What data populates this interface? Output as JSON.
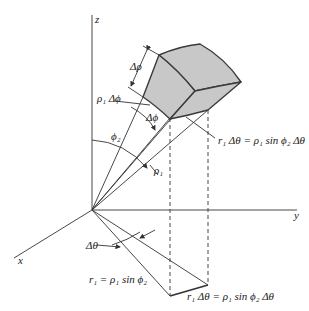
{
  "figure": {
    "axes": {
      "z_label": "z",
      "y_label": "y",
      "x_label": "x"
    },
    "labels": {
      "delta_rho": "Δρ",
      "rho1_delta_phi": "ρ₁ Δϕ",
      "delta_phi": "Δϕ",
      "phi2": "ϕ₂",
      "rho1": "ρ₁",
      "r1_dtheta_top": "r₁ Δθ = ρ₁ sin ϕ₂ Δθ",
      "delta_theta": "Δθ",
      "r1_eq": "r₁ = ρ₁ sin ϕ₂",
      "r1_dtheta_bottom": "r₁ Δθ = ρ₁ sin ϕ₂ Δθ"
    },
    "colors": {
      "line": "#333333",
      "box_fill": "#c8c8c8",
      "box_edge": "#3a3a3a"
    }
  }
}
